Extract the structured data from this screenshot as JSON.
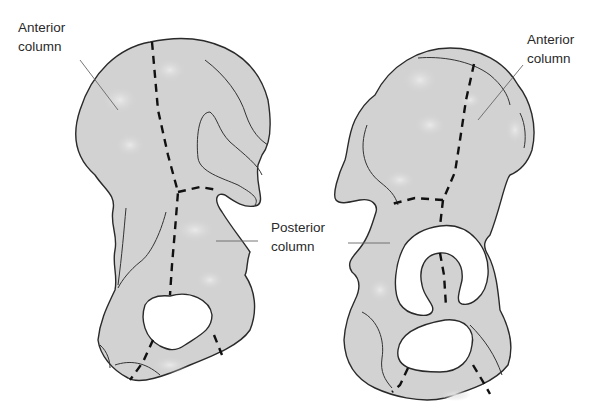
{
  "figure": {
    "left_view": {
      "labels": {
        "anterior": "Anterior\ncolumn"
      }
    },
    "right_view": {
      "labels": {
        "anterior": "Anterior\ncolumn"
      }
    },
    "shared_labels": {
      "posterior": "Posterior\ncolumn"
    },
    "colors": {
      "bone_fill": "#d2d2d2",
      "outline": "#2a2a2a",
      "dashed_boundary": "#111111",
      "background": "#ffffff"
    }
  }
}
